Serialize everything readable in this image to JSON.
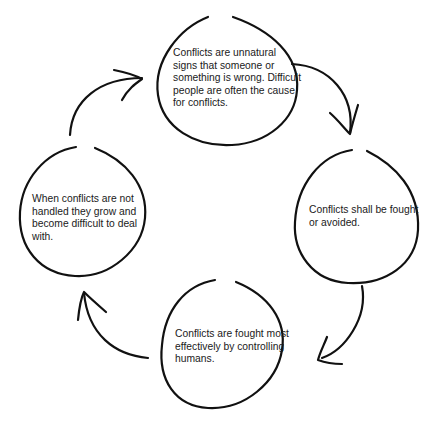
{
  "diagram": {
    "type": "cycle",
    "stroke_color": "#111111",
    "background": "#ffffff",
    "nodes": [
      {
        "id": "top",
        "text": "Conflicts are unnatural signs that someone or something is wrong. Difficult people are often the cause for conflicts."
      },
      {
        "id": "right",
        "text": "Conflicts shall be fought or avoided."
      },
      {
        "id": "bottom",
        "text": "Conflicts are fought most effectively by controlling humans."
      },
      {
        "id": "left",
        "text": "When conflicts are not handled they grow and become difficult to deal with."
      }
    ],
    "edges": [
      {
        "from": "top",
        "to": "right",
        "direction": "clockwise"
      },
      {
        "from": "right",
        "to": "bottom",
        "direction": "clockwise"
      },
      {
        "from": "bottom",
        "to": "left",
        "direction": "clockwise"
      },
      {
        "from": "left",
        "to": "top",
        "direction": "clockwise"
      }
    ]
  }
}
